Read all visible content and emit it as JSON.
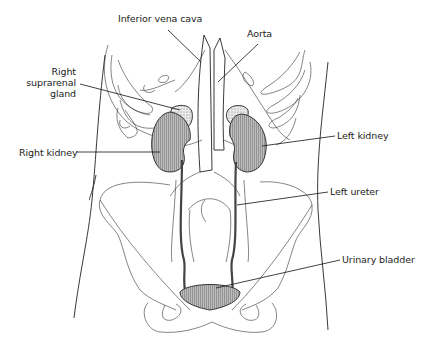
{
  "diagram": {
    "labels": [
      {
        "id": "inferior-vena-cava",
        "text": "Inferior vena cava"
      },
      {
        "id": "aorta",
        "text": "Aorta"
      },
      {
        "id": "right-suprarenal-gland",
        "lines": [
          "Right",
          "suprarenal",
          "gland"
        ]
      },
      {
        "id": "right-kidney",
        "text": "Right kidney"
      },
      {
        "id": "left-kidney",
        "text": "Left kidney"
      },
      {
        "id": "left-ureter",
        "text": "Left ureter"
      },
      {
        "id": "urinary-bladder",
        "text": "Urinary bladder"
      }
    ],
    "colors": {
      "line": "#222222",
      "organ_fill": "#8a8a8a",
      "background": "#ffffff"
    }
  }
}
